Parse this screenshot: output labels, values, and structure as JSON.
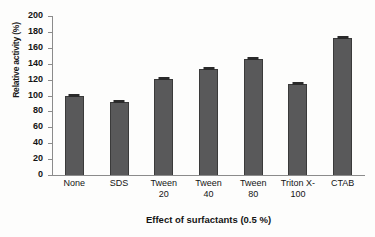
{
  "chart_data": {
    "type": "bar",
    "title": "",
    "xlabel": "Effect of surfactants (0.5 %)",
    "ylabel": "Relative activity (%)",
    "categories": [
      "None",
      "SDS",
      "Tween 20",
      "Tween 40",
      "Tween 80",
      "Triton X-100",
      "CTAB"
    ],
    "category_lines": [
      [
        "None"
      ],
      [
        "SDS"
      ],
      [
        "Tween",
        "20"
      ],
      [
        "Tween",
        "40"
      ],
      [
        "Tween",
        "80"
      ],
      [
        "Triton X-",
        "100"
      ],
      [
        "CTAB"
      ]
    ],
    "values": [
      100,
      92,
      121,
      133,
      146,
      115,
      172
    ],
    "error_bars": [
      1.5,
      1.5,
      1.5,
      1.5,
      1.5,
      1.5,
      1.5
    ],
    "ylim": [
      0,
      200
    ],
    "ytick_labels": [
      "200",
      "180",
      "160",
      "140",
      "120",
      "100",
      "80",
      "60",
      "40",
      "20",
      "0"
    ],
    "ytick_values": [
      200,
      180,
      160,
      140,
      120,
      100,
      80,
      60,
      40,
      20,
      0
    ],
    "grid": false,
    "legend": null,
    "bar_color": "#59595a",
    "bar_edge_color": "#3a3a3a",
    "axis_color": "#8b8b8b"
  }
}
